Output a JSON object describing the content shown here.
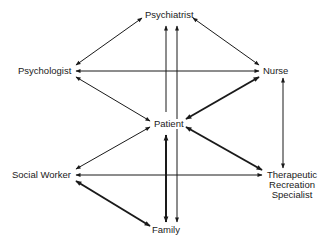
{
  "diagram": {
    "type": "communication-network",
    "nodes": [
      {
        "id": "psychiatrist",
        "label": "Psychiatrist"
      },
      {
        "id": "psychologist",
        "label": "Psychologist"
      },
      {
        "id": "nurse",
        "label": "Nurse"
      },
      {
        "id": "patient",
        "label": "Patient"
      },
      {
        "id": "social_worker",
        "label": "Social Worker"
      },
      {
        "id": "therapeutic",
        "label_lines": [
          "Therapeutic",
          "Recreation",
          "Specialist"
        ]
      },
      {
        "id": "family",
        "label": "Family"
      }
    ],
    "edges": [
      {
        "from": "psychologist",
        "to": "psychiatrist",
        "direction": "both",
        "weight": "normal"
      },
      {
        "from": "psychiatrist",
        "to": "nurse",
        "direction": "both",
        "weight": "normal"
      },
      {
        "from": "nurse",
        "to": "psychologist",
        "direction": "to",
        "weight": "normal"
      },
      {
        "from": "psychologist",
        "to": "patient",
        "direction": "both",
        "weight": "normal"
      },
      {
        "from": "patient",
        "to": "nurse",
        "direction": "both",
        "weight": "thick"
      },
      {
        "from": "patient",
        "to": "psychiatrist",
        "direction": "to",
        "weight": "normal"
      },
      {
        "from": "family",
        "to": "psychiatrist",
        "direction": "both",
        "weight": "normal"
      },
      {
        "from": "nurse",
        "to": "therapeutic",
        "direction": "both",
        "weight": "normal"
      },
      {
        "from": "social_worker",
        "to": "patient",
        "direction": "both",
        "weight": "normal"
      },
      {
        "from": "patient",
        "to": "therapeutic",
        "direction": "both",
        "weight": "thick"
      },
      {
        "from": "social_worker",
        "to": "therapeutic",
        "direction": "both",
        "weight": "normal"
      },
      {
        "from": "social_worker",
        "to": "family",
        "direction": "both",
        "weight": "thick"
      },
      {
        "from": "patient",
        "to": "family",
        "direction": "both",
        "weight": "thick"
      }
    ],
    "colors": {
      "line": "#1a1a1a",
      "text": "#1a1a1a",
      "background": "#ffffff"
    }
  }
}
